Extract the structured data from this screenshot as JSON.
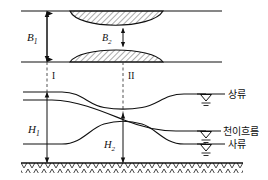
{
  "figure": {
    "colors": {
      "line": "#101010",
      "hatch": "#303030",
      "background": "#ffffff",
      "dashed": "#404040"
    },
    "plan_view": {
      "name": "plan-view",
      "wall_top_label": "",
      "wall_bottom_label": "",
      "width_upstream": {
        "symbol": "B",
        "subscript": "1",
        "full": "B₁"
      },
      "width_throat": {
        "symbol": "B",
        "subscript": "2",
        "full": "B₂"
      },
      "constriction_fill": "diagonal-hatch"
    },
    "sections": [
      {
        "id": "I",
        "label": "I",
        "x": 47
      },
      {
        "id": "II",
        "label": "II",
        "x": 123
      }
    ],
    "profile_view": {
      "name": "profile-view",
      "depth_upstream": {
        "symbol": "H",
        "subscript": "1",
        "full": "H₁"
      },
      "depth_throat": {
        "symbol": "H",
        "subscript": "2",
        "full": "H₂"
      },
      "bed_fill": "chevron-hatch"
    },
    "flow_labels": [
      {
        "key": "subcritical",
        "label": "상류",
        "symbol": "water-surface-symbol"
      },
      {
        "key": "transitional",
        "label": "천이흐름",
        "symbol": "water-surface-symbol"
      },
      {
        "key": "supercritical",
        "label": "사류",
        "symbol": "water-surface-symbol"
      }
    ]
  }
}
